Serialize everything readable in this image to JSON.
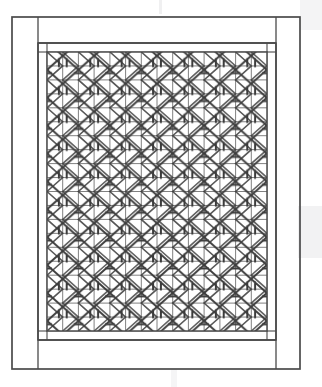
{
  "document": {
    "type": "line-drawing",
    "subject": "lattice window panel",
    "style": "chinese-geometric-latticework",
    "title": "Lattice window panel elevation drawing",
    "medium": "scanned ink line drawing",
    "background_color": "#ffffff",
    "ink_color": "#4a4a4a",
    "ink_color_dark": "#3a3a3a",
    "ink_color_light": "#6e6e6e",
    "artifact_color": "#e9e9ea",
    "canvas": {
      "width": 322,
      "height": 387
    }
  },
  "frame": {
    "outer": {
      "name": "outer frame",
      "x": 12,
      "y": 17,
      "width": 288,
      "height": 352,
      "stroke_width": 1.6
    },
    "left_stile": {
      "name": "left vertical stile",
      "x1": 38,
      "x2": 38,
      "width": 26
    },
    "right_stile": {
      "name": "right vertical stile",
      "x1": 276,
      "x2": 276,
      "width": 24
    },
    "top_rail": {
      "name": "top horizontal rail",
      "y": 43,
      "height": 26
    },
    "bottom_rail": {
      "name": "bottom horizontal rail",
      "y": 340,
      "height": 29
    }
  },
  "inner_border": {
    "name": "inner lattice border",
    "x": 38,
    "y": 43,
    "width": 238,
    "height": 297,
    "band_thickness": 7,
    "corner_block_size": 9
  },
  "lattice": {
    "name": "lattice field",
    "x": 47,
    "y": 52,
    "width": 220,
    "height": 279,
    "grid": {
      "columns": 14,
      "rows": 20,
      "cell_width": 15.7,
      "cell_height": 14.0,
      "line_width": 0.85,
      "description": "fine orthogonal mullion grid"
    },
    "motif": {
      "type": "zigzag-chevron",
      "repeats_horizontal": 7,
      "repeats_vertical": 10,
      "unit_width": 31.4,
      "unit_height": 27.9,
      "line_width": 2.0,
      "description": "bold diagonal zigzag bands forming interlocking triangular chevrons"
    }
  },
  "artifacts": [
    {
      "name": "scan-line-bottom",
      "x": 173,
      "y": 372,
      "width": 2,
      "height": 15,
      "color": "#e4e4e6"
    },
    {
      "name": "scan-patch-right-upper",
      "x": 300,
      "y": 0,
      "width": 22,
      "height": 30,
      "color": "#f1f1f2"
    },
    {
      "name": "scan-patch-right-lower",
      "x": 298,
      "y": 206,
      "width": 24,
      "height": 52,
      "color": "#f0f0f1"
    },
    {
      "name": "scan-edge-top",
      "x": 160,
      "y": 0,
      "width": 3,
      "height": 14,
      "color": "#efeff0"
    }
  ],
  "labels": {
    "figure_caption": "",
    "panel_name": "Lattice window panel"
  }
}
